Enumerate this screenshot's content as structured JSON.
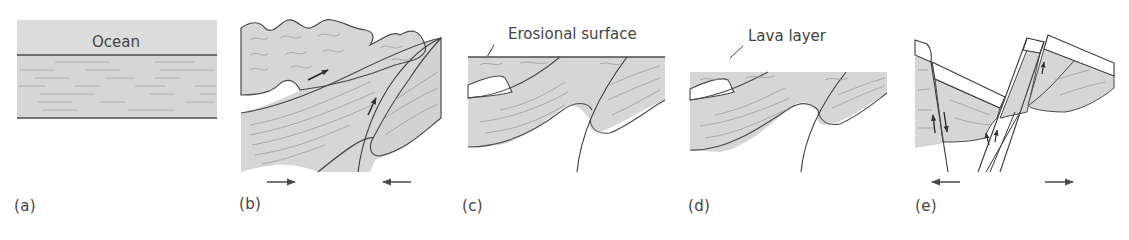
{
  "figure": {
    "colors": {
      "rock_fill": "#d6d6d6",
      "stroke": "#4a4a4a",
      "bedding": "#9a9a9a",
      "lava_fill": "#ffffff",
      "background": "#ffffff"
    }
  },
  "panels": [
    {
      "id": "a",
      "label": "(a)",
      "annotation": "Ocean",
      "stage": "Horizontal sediment layers deposited beneath ocean"
    },
    {
      "id": "b",
      "label": "(b)",
      "annotation": "",
      "stage": "Compression: folding and thrust faulting",
      "arrows": [
        "right",
        "left"
      ]
    },
    {
      "id": "c",
      "label": "(c)",
      "annotation": "Erosional surface",
      "stage": "Erosion truncates folded layers"
    },
    {
      "id": "d",
      "label": "(d)",
      "annotation": "Lava layer",
      "stage": "Lava layer deposited on erosional surface"
    },
    {
      "id": "e",
      "label": "(e)",
      "annotation": "",
      "stage": "Extension: normal faulting tilts blocks",
      "arrows": [
        "left",
        "right"
      ]
    }
  ]
}
